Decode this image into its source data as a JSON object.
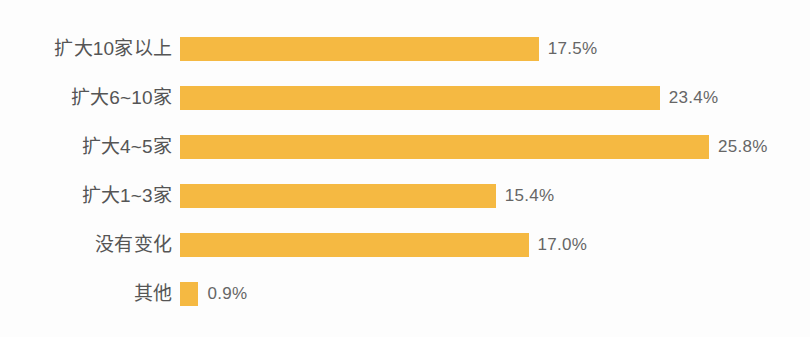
{
  "chart_data": {
    "type": "bar",
    "orientation": "horizontal",
    "title": "",
    "subtitle": "",
    "xlabel": "",
    "ylabel": "",
    "grid": false,
    "legend": false,
    "xlim": [
      0,
      25.8
    ],
    "units": "%",
    "bar_color": "#f5b942",
    "label_color": "#555555",
    "value_color": "#666666",
    "background_color": "#fdfdfd",
    "px_per_unit": 20.5,
    "categories": [
      "扩大10家以上",
      "扩大6~10家",
      "扩大4~5家",
      "扩大1~3家",
      "没有变化",
      "其他"
    ],
    "values": [
      17.5,
      23.4,
      25.8,
      15.4,
      17.0,
      0.9
    ],
    "value_labels": [
      "17.5%",
      "23.4%",
      "25.8%",
      "15.4%",
      "17.0%",
      "0.9%"
    ],
    "bars": [
      {
        "category": "扩大10家以上",
        "value": 17.5,
        "value_label": "17.5%"
      },
      {
        "category": "扩大6~10家",
        "value": 23.4,
        "value_label": "23.4%"
      },
      {
        "category": "扩大4~5家",
        "value": 25.8,
        "value_label": "25.8%"
      },
      {
        "category": "扩大1~3家",
        "value": 15.4,
        "value_label": "15.4%"
      },
      {
        "category": "没有变化",
        "value": 17.0,
        "value_label": "17.0%"
      },
      {
        "category": "其他",
        "value": 0.9,
        "value_label": "0.9%"
      }
    ]
  }
}
